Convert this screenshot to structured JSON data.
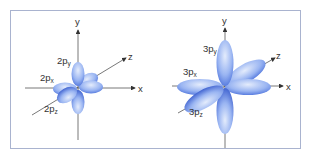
{
  "diagram": {
    "colors": {
      "lobe_light": "#dbe6fb",
      "lobe_mid": "#8fadf0",
      "lobe_dark": "#3d63d6",
      "axis": "#555555",
      "border": "#a9b3cf"
    },
    "panels": [
      {
        "id": "2p",
        "axes": {
          "x": "x",
          "y": "y",
          "z": "z"
        },
        "orbitals": [
          {
            "main": "2p",
            "sub": "y"
          },
          {
            "main": "2p",
            "sub": "x"
          },
          {
            "main": "2p",
            "sub": "z"
          }
        ]
      },
      {
        "id": "3p",
        "axes": {
          "x": "x",
          "y": "y",
          "z": "z"
        },
        "orbitals": [
          {
            "main": "3p",
            "sub": "y"
          },
          {
            "main": "3p",
            "sub": "x"
          },
          {
            "main": "3p",
            "sub": "z"
          }
        ]
      }
    ]
  }
}
